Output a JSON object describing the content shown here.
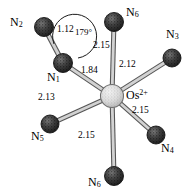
{
  "figure": {
    "type": "molecular-structure-diagram",
    "colors": {
      "background": "#ffffff",
      "nitrogen_sphere": "#3b3b3b",
      "nitrogen_sphere_dark": "#262626",
      "metal_sphere": "#d8d8d8",
      "metal_sphere_edge": "#7a7a7a",
      "bond_outline": "#555555",
      "bond_fill": "#d5d5d5",
      "text": "#000000"
    }
  },
  "center_atom": {
    "element": "Os",
    "charge": "2+",
    "label_x": 128,
    "label_y": 92,
    "cx": 112,
    "cy": 96,
    "r": 11.5
  },
  "atoms": [
    {
      "id": "n1",
      "label": "N",
      "subscript": "1",
      "cx": 63,
      "cy": 63,
      "r": 9.5,
      "label_x": 48,
      "label_y": 76
    },
    {
      "id": "n2",
      "label": "N",
      "subscript": "2",
      "cx": 44,
      "cy": 27,
      "r": 9.5,
      "label_x": 10,
      "label_y": 22
    },
    {
      "id": "n3",
      "label": "N",
      "subscript": "3",
      "cx": 172,
      "cy": 58,
      "r": 9.0,
      "label_x": 168,
      "label_y": 34
    },
    {
      "id": "n4",
      "label": "N",
      "subscript": "4",
      "cx": 156,
      "cy": 135,
      "r": 9.0,
      "label_x": 162,
      "label_y": 148
    },
    {
      "id": "n5",
      "label": "N",
      "subscript": "5",
      "cx": 50,
      "cy": 124,
      "r": 9.0,
      "label_x": 33,
      "label_y": 136
    },
    {
      "id": "n6_top",
      "label": "N",
      "subscript": "6",
      "cx": 114,
      "cy": 22,
      "r": 9.5,
      "label_x": 126,
      "label_y": 12
    },
    {
      "id": "n6_bottom",
      "label": "N",
      "subscript": "6",
      "cx": 114,
      "cy": 176,
      "r": 9.5,
      "label_x": 89,
      "label_y": 181
    }
  ],
  "bonds": [
    {
      "id": "bond-n1-n2",
      "from": "n2",
      "to": "n1",
      "length": "1.12",
      "label_x": 59,
      "label_y": 30
    },
    {
      "id": "bond-os-n1",
      "from": "n1",
      "to": "os",
      "length": "1.84",
      "label_x": 83,
      "label_y": 70
    },
    {
      "id": "bond-os-n6t",
      "from": "n6_top",
      "to": "os",
      "length": "2.15",
      "label_x": 95,
      "label_y": 45
    },
    {
      "id": "bond-os-n3",
      "from": "n3",
      "to": "os",
      "length": "2.12",
      "label_x": 121,
      "label_y": 64
    },
    {
      "id": "bond-os-n4",
      "from": "n4",
      "to": "os",
      "length": "2.15",
      "label_x": 134,
      "label_y": 110
    },
    {
      "id": "bond-os-n6b",
      "from": "n6_bottom",
      "to": "os",
      "length": "2.15",
      "label_x": 80,
      "label_y": 135
    },
    {
      "id": "bond-os-n5",
      "from": "n5",
      "to": "os",
      "length": "2.13",
      "label_x": 40,
      "label_y": 97
    }
  ],
  "angles": [
    {
      "id": "angle-n2-n1-os",
      "value": "179°",
      "label_x": 77,
      "label_y": 33
    }
  ]
}
